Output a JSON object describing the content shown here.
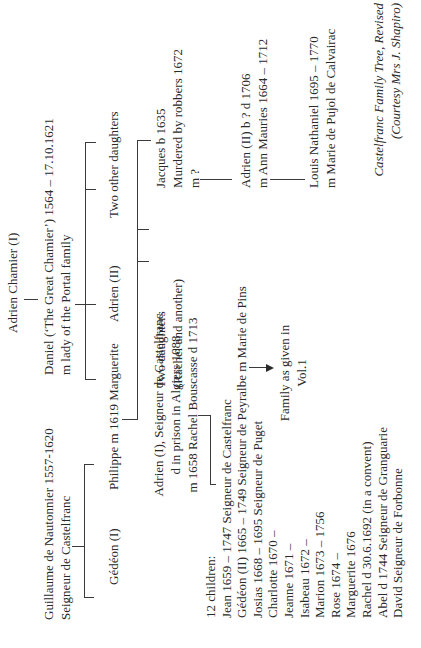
{
  "root": {
    "name": "Adrien Chamier (I)"
  },
  "daniel": {
    "line1": "Daniel (‘The Great Chamier’) 1564 – 17.10.1621",
    "line2": "m lady of the Portal family"
  },
  "guillaume": {
    "line1": "Guillaume de Nautonnier 1557-1620",
    "line2": "Seigneur de Castelfranc"
  },
  "generation2": [
    {
      "label": "Gédéon (I)"
    },
    {
      "label": "Philippe m 1619 Marguerite"
    },
    {
      "label": "Adrien (II)"
    },
    {
      "label": "Two other daughters"
    }
  ],
  "adrien_i": {
    "line1": "Adrien (I), Seigneur de Castelfranc",
    "line2": "d in prison in Algiers 1688",
    "line3": "m 1658 Rachel Bouscasse d 1713"
  },
  "two_daughters": {
    "line1": "Two daughters",
    "line2": "(Rachel and another)"
  },
  "jacques": {
    "line1": "Jacques b 1635",
    "line2": "Murdered by robbers 1672",
    "line3": "m ?"
  },
  "adrien_ii_b": {
    "line1": "Adrien (II) b ? d 1706",
    "line2": "m Ann Mauries 1664 – 1712"
  },
  "louis": {
    "line1": "Louis Nathaniel 1695 – 1770",
    "line2": "m Marie de Pujol de Calvairac"
  },
  "children": {
    "heading": "12 children:",
    "items": [
      "Jean 1659 – 1747 Seigneur de Castelfranc",
      "Gédéon (II) 1665 – 1749 Seigneur de Peyralbe m Marie de Pins",
      "Josias 1668 – 1695 Seigneur de Puget",
      "Charlotte 1670 –",
      "Jeanne 1671 –",
      "Isabeau 1672 –",
      "Marion 1673 – 1756",
      "Rose 1674 –",
      "Marguerite 1676",
      "Rachel d 30.6.1692 (in a convent)",
      "Abel d 1744 Seigneur de Granguarie",
      "David Seigneur de Forbonne"
    ]
  },
  "note": {
    "line1": "Family as given in",
    "line2": "Vol.1"
  },
  "caption": {
    "line1": "Castelfranc Family Tree, Revised",
    "line2": "(Courtesy Mrs J. Shapiro)"
  }
}
